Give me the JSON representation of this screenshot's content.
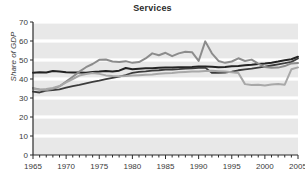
{
  "chart_data": {
    "type": "line",
    "title": "Services",
    "xlabel": "",
    "ylabel": "Share of GDP",
    "xlim": [
      1965,
      2005
    ],
    "ylim": [
      0,
      70
    ],
    "ytick_values": [
      0,
      10,
      20,
      30,
      40,
      50,
      60,
      70
    ],
    "ytick_labels": [
      "0",
      "10",
      "20",
      "30",
      "40",
      "50",
      "60",
      "70"
    ],
    "xtick_values": [
      1965,
      1970,
      1975,
      1980,
      1985,
      1990,
      1995,
      2000,
      2005
    ],
    "xtick_labels": [
      "1965",
      "1970",
      "1975",
      "1980",
      "1985",
      "1990",
      "1995",
      "2000",
      "2005"
    ],
    "xminor_step": 1,
    "grid": "horizontal-white-on-gray-bands",
    "legend": "none",
    "plot_bg": "#e8e8e8",
    "gridline_color": "#ffffff",
    "x": [
      1965,
      1966,
      1967,
      1968,
      1969,
      1970,
      1971,
      1972,
      1973,
      1974,
      1975,
      1976,
      1977,
      1978,
      1979,
      1980,
      1981,
      1982,
      1983,
      1984,
      1985,
      1986,
      1987,
      1988,
      1989,
      1990,
      1991,
      1992,
      1993,
      1994,
      1995,
      1996,
      1997,
      1998,
      1999,
      2000,
      2001,
      2002,
      2003,
      2004,
      2005
    ],
    "series": [
      {
        "name": "series-dark",
        "color": "#232323",
        "width": 2.0,
        "values": [
          43.3,
          43.6,
          43.4,
          44.2,
          43.9,
          43.6,
          43.4,
          43.4,
          43.3,
          43.7,
          43.9,
          44.2,
          44.0,
          44.4,
          45.8,
          45.1,
          45.4,
          45.6,
          45.7,
          45.9,
          46.0,
          46.1,
          46.2,
          46.2,
          46.3,
          46.6,
          46.6,
          46.4,
          46.2,
          46.3,
          46.7,
          46.9,
          47.2,
          47.5,
          47.9,
          48.2,
          48.6,
          49.2,
          49.9,
          50.4,
          51.7
        ]
      },
      {
        "name": "series-mid-dark",
        "color": "#3c3c3c",
        "width": 1.8,
        "values": [
          33.4,
          32.9,
          33.9,
          34.2,
          34.5,
          35.4,
          36.3,
          36.9,
          37.7,
          38.5,
          39.1,
          39.9,
          40.6,
          41.3,
          42.1,
          43.2,
          43.7,
          44.0,
          44.4,
          44.6,
          44.9,
          45.0,
          45.2,
          45.5,
          45.6,
          45.9,
          46.0,
          43.2,
          43.2,
          43.4,
          43.9,
          44.6,
          45.1,
          45.5,
          46.0,
          46.5,
          47.1,
          47.7,
          48.3,
          49.0,
          50.8
        ]
      },
      {
        "name": "series-gray-volatile",
        "color": "#8c8c8c",
        "width": 2.0,
        "values": [
          35.2,
          34.5,
          34.0,
          34.9,
          36.1,
          38.6,
          41.2,
          43.9,
          46.2,
          47.9,
          50.1,
          50.3,
          49.2,
          48.9,
          49.4,
          48.5,
          48.9,
          50.8,
          53.5,
          52.5,
          53.8,
          52.0,
          53.5,
          54.3,
          54.1,
          49.5,
          59.8,
          53.5,
          49.5,
          48.5,
          49.2,
          50.9,
          49.5,
          50.2,
          48.1,
          46.3,
          45.9,
          46.0,
          46.8,
          48.2,
          48.4
        ]
      },
      {
        "name": "series-light-gray",
        "color": "#a8a8a8",
        "width": 2.0,
        "values": [
          34.9,
          34.3,
          34.7,
          35.3,
          36.3,
          38.2,
          40.0,
          41.8,
          42.6,
          43.1,
          42.7,
          41.9,
          41.6,
          41.5,
          41.6,
          41.8,
          42.0,
          42.2,
          42.4,
          42.7,
          43.0,
          43.2,
          43.5,
          43.7,
          43.9,
          44.0,
          44.2,
          44.3,
          44.1,
          43.9,
          43.5,
          43.1,
          37.3,
          36.9,
          37.0,
          36.6,
          37.1,
          37.4,
          37.0,
          45.1,
          46.1
        ]
      }
    ]
  }
}
